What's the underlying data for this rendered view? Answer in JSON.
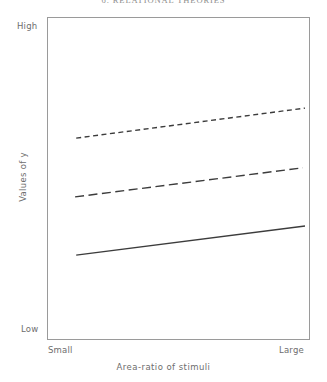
{
  "page": {
    "running_header": "6. RELATIONAL THEORIES"
  },
  "chart_data": {
    "type": "line",
    "title": "",
    "xlabel": "Area-ratio of stimuli",
    "ylabel": "Values of y",
    "x_tick_labels": [
      "Small",
      "Large"
    ],
    "y_tick_labels": [
      "Low",
      "High"
    ],
    "xlim": [
      "Small",
      "Large"
    ],
    "ylim": [
      "Low",
      "High"
    ],
    "grid": false,
    "legend": "none",
    "frame": true,
    "x": [
      "Small",
      "Large"
    ],
    "series": [
      {
        "name": "upper",
        "style": "short-dashed",
        "color": "#3c3c3c",
        "values": [
          0.625,
          0.718
        ],
        "points": [
          [
            0.111,
            0.625
          ],
          [
            0.981,
            0.718
          ]
        ]
      },
      {
        "name": "middle",
        "style": "long-dashed",
        "color": "#3c3c3c",
        "values": [
          0.443,
          0.533
        ],
        "points": [
          [
            0.107,
            0.443
          ],
          [
            0.973,
            0.533
          ]
        ]
      },
      {
        "name": "lower",
        "style": "solid",
        "color": "#3c3c3c",
        "values": [
          0.263,
          0.353
        ],
        "points": [
          [
            0.111,
            0.263
          ],
          [
            0.981,
            0.353
          ]
        ]
      }
    ]
  }
}
